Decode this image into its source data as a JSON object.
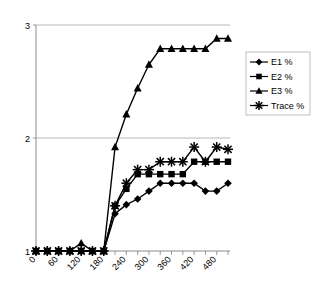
{
  "chart_data": {
    "type": "line",
    "title": "",
    "xlabel": "",
    "ylabel": "",
    "xlim": [
      0,
      510
    ],
    "ylim": [
      1,
      3
    ],
    "grid": true,
    "legend_position": "right",
    "x_tick_labels": [
      "0",
      "60",
      "120",
      "180",
      "240",
      "300",
      "360",
      "420",
      "480"
    ],
    "x_tick_values": [
      0,
      60,
      120,
      180,
      240,
      300,
      360,
      420,
      480
    ],
    "y_tick_labels": [
      "1",
      "2",
      "3"
    ],
    "y_tick_values": [
      1,
      2,
      3
    ],
    "x": [
      0,
      30,
      60,
      90,
      120,
      150,
      180,
      210,
      240,
      270,
      300,
      330,
      360,
      390,
      420,
      450,
      480,
      510
    ],
    "series": [
      {
        "name": "E1 %",
        "marker": "diamond",
        "color": "#000000",
        "values": [
          1.0,
          1.0,
          1.0,
          1.0,
          1.0,
          1.0,
          1.0,
          1.33,
          1.41,
          1.46,
          1.53,
          1.6,
          1.6,
          1.6,
          1.6,
          1.53,
          1.53,
          1.6
        ]
      },
      {
        "name": "E2 %",
        "marker": "square",
        "color": "#000000",
        "values": [
          1.0,
          1.0,
          1.0,
          1.0,
          1.0,
          1.0,
          1.0,
          1.4,
          1.55,
          1.68,
          1.68,
          1.68,
          1.68,
          1.68,
          1.79,
          1.79,
          1.79,
          1.79
        ]
      },
      {
        "name": "E3 %",
        "marker": "triangle",
        "color": "#000000",
        "values": [
          1.0,
          1.0,
          1.0,
          1.0,
          1.07,
          1.0,
          1.0,
          1.92,
          2.21,
          2.44,
          2.65,
          2.79,
          2.79,
          2.79,
          2.79,
          2.79,
          2.88,
          2.88
        ]
      },
      {
        "name": "Trace %",
        "marker": "star",
        "color": "#000000",
        "values": [
          1.0,
          1.0,
          1.0,
          1.0,
          1.0,
          1.0,
          1.0,
          1.4,
          1.6,
          1.72,
          1.72,
          1.79,
          1.79,
          1.79,
          1.92,
          1.79,
          1.92,
          1.9
        ]
      }
    ]
  },
  "legend": {
    "items": [
      {
        "label": "E1 %",
        "marker": "diamond-icon"
      },
      {
        "label": "E2 %",
        "marker": "square-icon"
      },
      {
        "label": "E3 %",
        "marker": "triangle-icon"
      },
      {
        "label": "Trace %",
        "marker": "star-icon"
      }
    ]
  },
  "axes": {
    "plot_left_px": 36,
    "plot_right_px": 228,
    "plot_top_px": 25,
    "plot_bottom_px": 251,
    "gridline_color": "#a6a6a6",
    "axis_color": "#808080"
  }
}
